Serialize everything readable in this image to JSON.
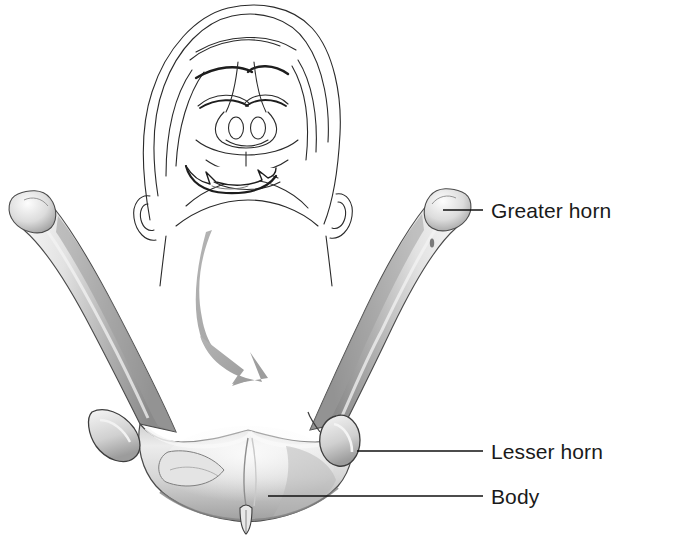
{
  "figure": {
    "background_color": "#ffffff",
    "line_color": "#1a1a1a",
    "bone_light": "#f2f2f2",
    "bone_mid": "#c9c9c9",
    "bone_dark": "#8e8e8e",
    "arrow_color": "#a6a6a6"
  },
  "inset": {
    "name": "head-anterior-inferior-view",
    "description": "Line drawing of a head tilted back showing the hyoid bone in situ in the neck"
  },
  "arrow": {
    "name": "orientation-arrow",
    "description": "Curved gray arrow pointing from the in-situ hyoid down to the enlarged specimen"
  },
  "labels": [
    {
      "id": "greater-horn",
      "text": "Greater horn",
      "leader": {
        "x1": 443,
        "y1": 210,
        "x2": 483,
        "y2": 210
      }
    },
    {
      "id": "lesser-horn",
      "text": "Lesser horn",
      "leader": {
        "x1": 357,
        "y1": 451,
        "x2": 483,
        "y2": 451
      }
    },
    {
      "id": "body",
      "text": "Body",
      "leader": {
        "x1": 268,
        "y1": 496,
        "x2": 483,
        "y2": 496
      }
    }
  ]
}
